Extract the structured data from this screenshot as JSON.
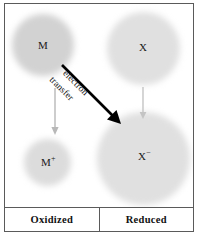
{
  "figure": {
    "title_text": "",
    "species": [
      {
        "id": "m",
        "label": "M",
        "charge": "",
        "name": "neutral-metal"
      },
      {
        "id": "x",
        "label": "X",
        "charge": "",
        "name": "neutral-nonmetal"
      },
      {
        "id": "mplus",
        "label": "M",
        "charge": "+",
        "name": "metal-cation"
      },
      {
        "id": "xminus",
        "label": "X",
        "charge": "−",
        "name": "nonmetal-anion"
      }
    ],
    "arrow_label": {
      "line1": "electron",
      "line2": "transfer"
    },
    "captions": {
      "left": "Oxidized",
      "right": "Reduced"
    },
    "colors": {
      "sphere_dark": "#d2d2d2",
      "sphere_light": "#dcdcdc",
      "sphere_lighter": "#e0e0e0",
      "arrow_gray": "#b4b4b4",
      "arrow_black": "#000000",
      "frame": "#5a5a5a",
      "text": "#111111",
      "background": "#ffffff"
    }
  }
}
